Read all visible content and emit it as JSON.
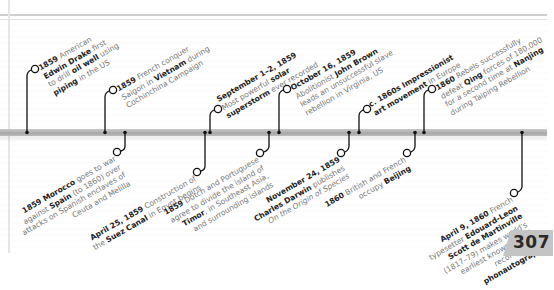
{
  "page": {
    "number": "307"
  },
  "colors": {
    "bar": "#b3b3b3",
    "connector": "#111111",
    "bold_text": "#222222",
    "body_text": "#777777",
    "page_tab": "#c4c4c4"
  },
  "timeline": {
    "above": [
      {
        "id": "drake",
        "lines": [
          [
            {
              "t": "1859",
              "b": true
            },
            {
              "t": " American"
            }
          ],
          [
            {
              "t": "Edwin Drake",
              "b": true
            },
            {
              "t": " first"
            }
          ],
          [
            {
              "t": "to drill "
            },
            {
              "t": "oil well",
              "b": true
            },
            {
              "t": " using"
            }
          ],
          [
            {
              "t": "piping",
              "b": true
            },
            {
              "t": " in the US"
            }
          ]
        ]
      },
      {
        "id": "saigon",
        "lines": [
          [
            {
              "t": "1859",
              "b": true
            },
            {
              "t": " French conquer"
            }
          ],
          [
            {
              "t": "Saigon in "
            },
            {
              "t": "Vietnam",
              "b": true
            },
            {
              "t": " during"
            }
          ],
          [
            {
              "t": "Cochinchina Campaign"
            }
          ]
        ]
      },
      {
        "id": "solar",
        "lines": [
          [
            {
              "t": "September 1–2, 1859",
              "b": true
            }
          ],
          [
            {
              "t": "Most powerful "
            },
            {
              "t": "solar",
              "b": true
            }
          ],
          [
            {
              "t": "superstorm",
              "b": true
            },
            {
              "t": " ever recorded"
            }
          ]
        ]
      },
      {
        "id": "brown",
        "lines": [
          [
            {
              "t": "October 16, 1859",
              "b": true
            }
          ],
          [
            {
              "t": "Abolitionist "
            },
            {
              "t": "John Brown",
              "b": true
            }
          ],
          [
            {
              "t": "leads an unsuccessful slave"
            }
          ],
          [
            {
              "t": "rebellion in Virginia, US"
            }
          ]
        ]
      },
      {
        "id": "impressionist",
        "lines": [
          [
            {
              "t": "c. 1860s Impressionist",
              "b": true
            }
          ],
          [
            {
              "t": "art movement",
              "b": true
            },
            {
              "t": " in Europe"
            }
          ]
        ]
      },
      {
        "id": "nanjing",
        "lines": [
          [
            {
              "t": "1860",
              "b": true
            },
            {
              "t": " Rebels successfully"
            }
          ],
          [
            {
              "t": "defeat "
            },
            {
              "t": "Qing",
              "b": true
            },
            {
              "t": " forces of 180,000"
            }
          ],
          [
            {
              "t": "for a second time at "
            },
            {
              "t": "Nanjing",
              "b": true
            }
          ],
          [
            {
              "t": "during Taiping Rebellion"
            }
          ]
        ]
      }
    ],
    "below": [
      {
        "id": "morocco",
        "lines": [
          [
            {
              "t": "1859 Morocco",
              "b": true
            },
            {
              "t": " goes to war"
            }
          ],
          [
            {
              "t": "against "
            },
            {
              "t": "Spain",
              "b": true
            },
            {
              "t": " (to 1860) over"
            }
          ],
          [
            {
              "t": "attacks on Spanish enclaves of"
            }
          ],
          [
            {
              "t": "Ceuta and Melilla"
            }
          ]
        ]
      },
      {
        "id": "suez",
        "lines": [
          [
            {
              "t": "April 25, 1859",
              "b": true
            },
            {
              "t": " Construction of"
            }
          ],
          [
            {
              "t": "the "
            },
            {
              "t": "Suez Canal",
              "b": true
            },
            {
              "t": " in Egypt begins"
            }
          ]
        ]
      },
      {
        "id": "timor",
        "lines": [
          [
            {
              "t": "1859",
              "b": true
            },
            {
              "t": " Dutch and Portuguese"
            }
          ],
          [
            {
              "t": "agree to divide the island of"
            }
          ],
          [
            {
              "t": "Timor",
              "b": true
            },
            {
              "t": ", in Southeast Asia,"
            }
          ],
          [
            {
              "t": "and surrounding islands"
            }
          ]
        ]
      },
      {
        "id": "darwin",
        "lines": [
          [
            {
              "t": "November 24, 1859",
              "b": true
            }
          ],
          [
            {
              "t": "Charles Darwin",
              "b": true
            },
            {
              "t": " publishes"
            }
          ],
          [
            {
              "t": "On the Origin of Species",
              "i": true
            }
          ]
        ]
      },
      {
        "id": "beijing",
        "lines": [
          [
            {
              "t": "1860",
              "b": true
            },
            {
              "t": " British and French"
            }
          ],
          [
            {
              "t": "occupy "
            },
            {
              "t": "Beijing",
              "b": true
            }
          ]
        ]
      },
      {
        "id": "phonautograph",
        "lines": [
          [
            {
              "t": "April 9, 1860",
              "b": true
            },
            {
              "t": " French"
            }
          ],
          [
            {
              "t": "typesetter "
            },
            {
              "t": "Edouard-Leon",
              "b": true
            }
          ],
          [
            {
              "t": "Scott de Martinville",
              "b": true
            }
          ],
          [
            {
              "t": "(1817–79) makes world's"
            }
          ],
          [
            {
              "t": "earliest known sound"
            }
          ],
          [
            {
              "t": "recording on"
            }
          ],
          [
            {
              "t": "phonautograph",
              "b": true
            }
          ]
        ]
      }
    ]
  }
}
